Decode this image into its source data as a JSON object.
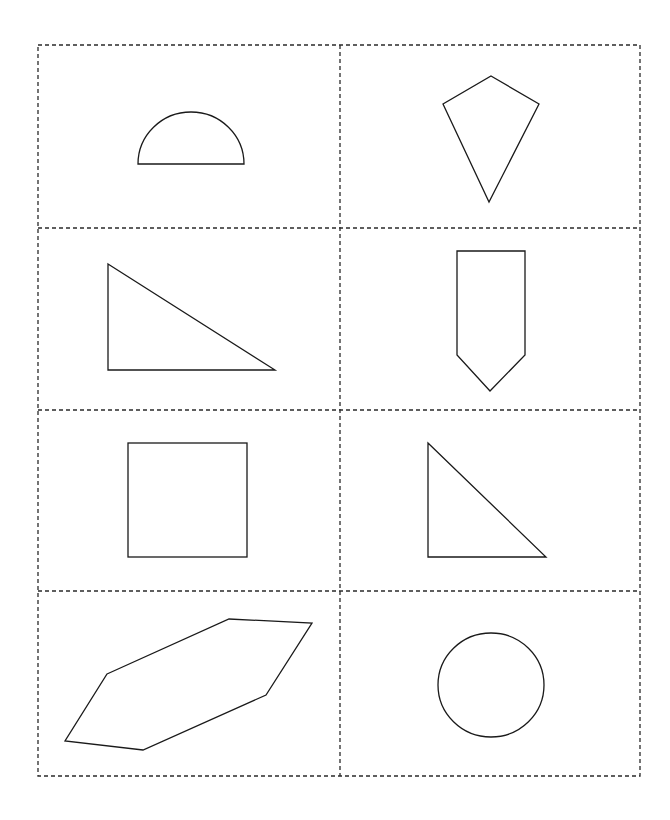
{
  "sheet": {
    "background": "#ffffff",
    "line_color": "#1a1a1a",
    "grid": {
      "rows": 4,
      "cols": 2,
      "x": [
        38,
        340,
        640
      ],
      "y": [
        45,
        228,
        410,
        591,
        776
      ],
      "style": "dashed"
    },
    "cells": [
      {
        "row": 1,
        "col": 1,
        "shape": "semicircle"
      },
      {
        "row": 1,
        "col": 2,
        "shape": "kite"
      },
      {
        "row": 2,
        "col": 1,
        "shape": "right-triangle"
      },
      {
        "row": 2,
        "col": 2,
        "shape": "pentagon"
      },
      {
        "row": 3,
        "col": 1,
        "shape": "square"
      },
      {
        "row": 3,
        "col": 2,
        "shape": "right-triangle"
      },
      {
        "row": 4,
        "col": 1,
        "shape": "hexagon"
      },
      {
        "row": 4,
        "col": 2,
        "shape": "circle"
      }
    ]
  }
}
